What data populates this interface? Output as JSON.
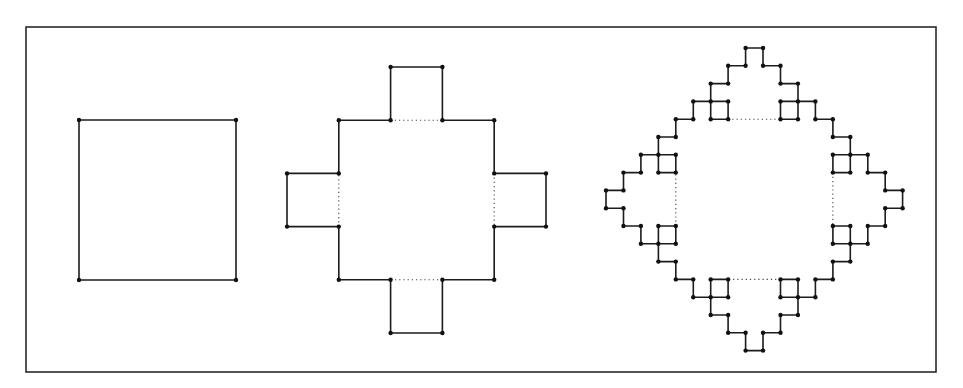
{
  "figure": {
    "frame": {
      "x1": 26,
      "y1": 27,
      "x2": 936,
      "y2": 372
    },
    "colors": {
      "line": "#1c1c1c",
      "node": "#111111",
      "dotted": "#444444",
      "background": "#ffffff"
    },
    "panels": [
      {
        "name": "iteration-0",
        "grid": {
          "x0": 79,
          "y0": 120,
          "dx": 157,
          "dy": 160
        },
        "path": [
          [
            0,
            0
          ],
          [
            1,
            0
          ],
          [
            1,
            1
          ],
          [
            0,
            1
          ],
          [
            0,
            0
          ]
        ],
        "dotted": []
      },
      {
        "name": "iteration-1",
        "grid": {
          "x0": 287,
          "y0": 67,
          "dx": 51.8,
          "dy": 53.2
        },
        "path": [
          [
            1,
            1
          ],
          [
            2,
            1
          ],
          [
            2,
            0
          ],
          [
            3,
            0
          ],
          [
            3,
            1
          ],
          [
            4,
            1
          ],
          [
            4,
            2
          ],
          [
            5,
            2
          ],
          [
            5,
            3
          ],
          [
            4,
            3
          ],
          [
            4,
            4
          ],
          [
            3,
            4
          ],
          [
            3,
            5
          ],
          [
            2,
            5
          ],
          [
            2,
            4
          ],
          [
            1,
            4
          ],
          [
            1,
            3
          ],
          [
            0,
            3
          ],
          [
            0,
            2
          ],
          [
            1,
            2
          ],
          [
            1,
            1
          ]
        ],
        "dotted": [
          [
            [
              2,
              1
            ],
            [
              3,
              1
            ]
          ],
          [
            [
              4,
              2
            ],
            [
              4,
              3
            ]
          ],
          [
            [
              3,
              4
            ],
            [
              2,
              4
            ]
          ],
          [
            [
              1,
              3
            ],
            [
              1,
              2
            ]
          ]
        ]
      },
      {
        "name": "iteration-2",
        "grid": {
          "x0": 606,
          "y0": 48,
          "dx": 17.45,
          "dy": 17.8
        },
        "generate_from": "iteration-1",
        "fine_offset": 1,
        "dotted": [
          [
            [
              7,
              4
            ],
            [
              10,
              4
            ]
          ],
          [
            [
              13,
              7
            ],
            [
              13,
              10
            ]
          ],
          [
            [
              10,
              13
            ],
            [
              7,
              13
            ]
          ],
          [
            [
              4,
              10
            ],
            [
              4,
              7
            ]
          ]
        ]
      }
    ]
  }
}
